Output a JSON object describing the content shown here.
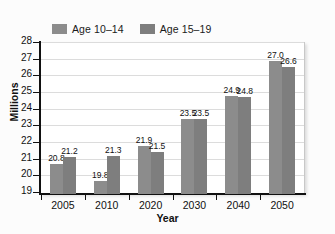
{
  "chart_data": {
    "type": "bar",
    "title": "",
    "xlabel": "Year",
    "ylabel": "Millions",
    "categories": [
      "2005",
      "2010",
      "2020",
      "2030",
      "2040",
      "2050"
    ],
    "series": [
      {
        "name": "Age 10–14",
        "color": "#8c8c8c",
        "values": [
          20.8,
          19.8,
          21.9,
          23.5,
          24.9,
          27.0
        ],
        "labels": [
          "20.8",
          "19.8",
          "21.9",
          "23.5",
          "24.9",
          "27.0"
        ]
      },
      {
        "name": "Age 15–19",
        "color": "#7e7e7e",
        "values": [
          21.2,
          21.3,
          21.5,
          23.5,
          24.8,
          26.6
        ],
        "labels": [
          "21.2",
          "21.3",
          "21.5",
          "23.5",
          "24.8",
          "26.6"
        ]
      }
    ],
    "ylim": [
      19,
      28
    ],
    "yticks": [
      19,
      20,
      21,
      22,
      23,
      24,
      25,
      26,
      27,
      28
    ],
    "ytick_labels": [
      "19",
      "20",
      "21",
      "22",
      "23",
      "24",
      "25",
      "26",
      "27",
      "28"
    ],
    "grid": "horizontal",
    "legend_position": "top-left",
    "plot_background": "#ffffff",
    "grid_color": "#dcdcdc",
    "axis_color": "#111111"
  }
}
